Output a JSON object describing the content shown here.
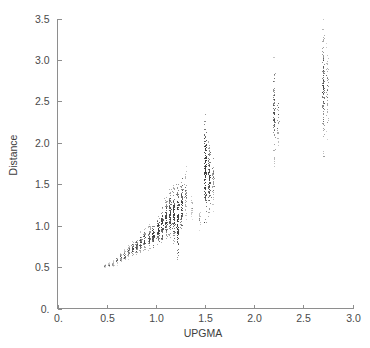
{
  "chart_data": {
    "type": "scatter",
    "title": "",
    "subtitle": "",
    "xlabel": "UPGMA",
    "ylabel": "Distance",
    "xlim": [
      0.0,
      3.0
    ],
    "ylim": [
      0.0,
      3.5
    ],
    "xticks": [
      0.0,
      0.5,
      1.0,
      1.5,
      2.0,
      2.5,
      3.0
    ],
    "xtick_labels": [
      "0.",
      "0.5",
      "1.0",
      "1.5",
      "2.0",
      "2.5",
      "3.0"
    ],
    "yticks": [
      0.0,
      0.5,
      1.0,
      1.5,
      2.0,
      2.5,
      3.0,
      3.5
    ],
    "ytick_labels": [
      "0.",
      "0.5",
      "1.0",
      "1.5",
      "2.0",
      "2.5",
      "3.0",
      "3.5"
    ],
    "grid": false,
    "legend": null,
    "legend_position": "none",
    "marker": "point",
    "marker_color": "#3a3a3a",
    "marker_size": 1,
    "clusters": [
      {
        "x": 0.48,
        "y_min": 0.5,
        "y_max": 0.54,
        "n": 10,
        "density": "sparse"
      },
      {
        "x": 0.52,
        "y_min": 0.5,
        "y_max": 0.56,
        "n": 12,
        "density": "sparse"
      },
      {
        "x": 0.56,
        "y_min": 0.51,
        "y_max": 0.59,
        "n": 14,
        "density": "sparse"
      },
      {
        "x": 0.6,
        "y_min": 0.53,
        "y_max": 0.64,
        "n": 18,
        "density": "sparse"
      },
      {
        "x": 0.64,
        "y_min": 0.55,
        "y_max": 0.68,
        "n": 22,
        "density": "light"
      },
      {
        "x": 0.68,
        "y_min": 0.57,
        "y_max": 0.73,
        "n": 26,
        "density": "light"
      },
      {
        "x": 0.72,
        "y_min": 0.6,
        "y_max": 0.79,
        "n": 30,
        "density": "light"
      },
      {
        "x": 0.76,
        "y_min": 0.62,
        "y_max": 0.82,
        "n": 34,
        "density": "medium"
      },
      {
        "x": 0.8,
        "y_min": 0.64,
        "y_max": 0.86,
        "n": 38,
        "density": "medium"
      },
      {
        "x": 0.84,
        "y_min": 0.66,
        "y_max": 0.93,
        "n": 40,
        "density": "medium"
      },
      {
        "x": 0.88,
        "y_min": 0.68,
        "y_max": 0.98,
        "n": 44,
        "density": "medium"
      },
      {
        "x": 0.93,
        "y_min": 0.7,
        "y_max": 1.02,
        "n": 48,
        "density": "medium"
      },
      {
        "x": 0.97,
        "y_min": 0.74,
        "y_max": 1.06,
        "n": 52,
        "density": "dense"
      },
      {
        "x": 1.02,
        "y_min": 0.78,
        "y_max": 1.12,
        "n": 60,
        "density": "dense"
      },
      {
        "x": 1.06,
        "y_min": 0.8,
        "y_max": 1.22,
        "n": 64,
        "density": "dense"
      },
      {
        "x": 1.1,
        "y_min": 0.84,
        "y_max": 1.34,
        "n": 72,
        "density": "dense"
      },
      {
        "x": 1.14,
        "y_min": 0.86,
        "y_max": 1.44,
        "n": 78,
        "density": "dense"
      },
      {
        "x": 1.18,
        "y_min": 0.78,
        "y_max": 1.49,
        "n": 84,
        "density": "dense"
      },
      {
        "x": 1.22,
        "y_min": 0.6,
        "y_max": 1.5,
        "n": 96,
        "density": "very-dense"
      },
      {
        "x": 1.26,
        "y_min": 0.9,
        "y_max": 1.58,
        "n": 70,
        "density": "dense"
      },
      {
        "x": 1.3,
        "y_min": 1.05,
        "y_max": 1.76,
        "n": 40,
        "density": "light"
      },
      {
        "x": 1.36,
        "y_min": 1.08,
        "y_max": 1.42,
        "n": 16,
        "density": "sparse"
      },
      {
        "x": 1.44,
        "y_min": 0.94,
        "y_max": 1.22,
        "n": 14,
        "density": "sparse"
      },
      {
        "x": 1.5,
        "y_min": 1.05,
        "y_max": 2.35,
        "n": 130,
        "density": "very-dense"
      },
      {
        "x": 1.54,
        "y_min": 1.12,
        "y_max": 2.02,
        "n": 90,
        "density": "dense"
      },
      {
        "x": 1.58,
        "y_min": 1.18,
        "y_max": 1.96,
        "n": 40,
        "density": "light"
      },
      {
        "x": 2.2,
        "y_min": 1.72,
        "y_max": 3.04,
        "n": 85,
        "density": "medium"
      },
      {
        "x": 2.24,
        "y_min": 1.9,
        "y_max": 2.62,
        "n": 30,
        "density": "light"
      },
      {
        "x": 2.7,
        "y_min": 1.84,
        "y_max": 3.5,
        "n": 120,
        "density": "medium"
      },
      {
        "x": 2.74,
        "y_min": 2.05,
        "y_max": 3.22,
        "n": 45,
        "density": "light"
      }
    ]
  },
  "axes": {
    "x_axis_name": "UPGMA",
    "y_axis_name": "Distance"
  }
}
